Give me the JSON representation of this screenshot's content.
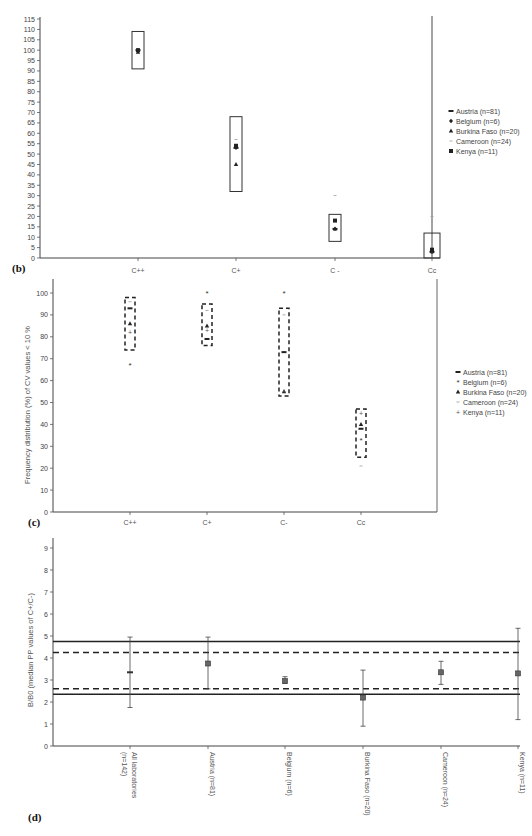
{
  "chart_data": [
    {
      "panel": "(b)",
      "type": "scatter",
      "title": "",
      "xlabel": "",
      "ylabel": "",
      "ylim": [
        0,
        115
      ],
      "yticks": [
        0,
        5,
        10,
        15,
        20,
        25,
        30,
        35,
        40,
        45,
        50,
        55,
        60,
        65,
        70,
        75,
        80,
        85,
        90,
        95,
        100,
        105,
        110,
        115
      ],
      "categories": [
        "C++",
        "C+",
        "C -",
        "Cc"
      ],
      "boxes": [
        {
          "category": "C++",
          "low": 91,
          "high": 109,
          "style": "solid"
        },
        {
          "category": "C+",
          "low": 32,
          "high": 68,
          "style": "solid"
        },
        {
          "category": "C -",
          "low": 8,
          "high": 21,
          "style": "solid"
        },
        {
          "category": "Cc",
          "low": 0,
          "high": 12,
          "style": "solid"
        }
      ],
      "series": [
        {
          "name": "Austria (n=81)",
          "marker": "dash",
          "values": [
            100,
            53,
            14,
            3
          ]
        },
        {
          "name": "Belgium (n=6)",
          "marker": "diamond",
          "values": [
            100,
            53,
            14,
            3
          ]
        },
        {
          "name": "Burkina Faso (n=20)",
          "marker": "triangle",
          "values": [
            99,
            45,
            14,
            3
          ]
        },
        {
          "name": "Cameroon (n=24)",
          "marker": "minus",
          "values": [
            100,
            57,
            30,
            20
          ]
        },
        {
          "name": "Kenya (n=11)",
          "marker": "square",
          "values": [
            100,
            54,
            18,
            4
          ]
        }
      ],
      "legend_position": "right",
      "grid": false
    },
    {
      "panel": "(c)",
      "type": "scatter",
      "title": "",
      "xlabel": "",
      "ylabel": "Frequency distribution (%) of CV values < 10 %",
      "ylim": [
        0,
        100
      ],
      "yticks": [
        0,
        10,
        20,
        30,
        40,
        50,
        60,
        70,
        80,
        90,
        100
      ],
      "categories": [
        "C++",
        "C+",
        "C-",
        "Cc"
      ],
      "boxes": [
        {
          "category": "C++",
          "low": 74,
          "high": 98,
          "style": "dashed"
        },
        {
          "category": "C+",
          "low": 76,
          "high": 95,
          "style": "dashed"
        },
        {
          "category": "C-",
          "low": 53,
          "high": 93,
          "style": "dashed"
        },
        {
          "category": "Cc",
          "low": 25,
          "high": 47,
          "style": "dashed"
        }
      ],
      "series": [
        {
          "name": "Austria (n=81)",
          "marker": "dash",
          "values": [
            93,
            79,
            73,
            38
          ]
        },
        {
          "name": "Belgium (n=6)",
          "marker": "asterisk",
          "values": [
            67,
            100,
            100,
            33
          ]
        },
        {
          "name": "Burkina Faso (n=20)",
          "marker": "triangle",
          "values": [
            86,
            85,
            55,
            40
          ]
        },
        {
          "name": "Cameroon (n=24)",
          "marker": "minus",
          "values": [
            96,
            92,
            90,
            21
          ]
        },
        {
          "name": "Kenya (n=11)",
          "marker": "plus",
          "values": [
            82,
            83,
            55,
            45
          ]
        }
      ],
      "legend_position": "right",
      "grid": false
    },
    {
      "panel": "(d)",
      "type": "scatter",
      "title": "",
      "xlabel": "",
      "ylabel": "B/B0 (median PP values of C+/C-)",
      "ylim": [
        0,
        9
      ],
      "yticks": [
        0,
        1,
        2,
        3,
        4,
        5,
        6,
        7,
        8,
        9
      ],
      "categories": [
        "All laboratories (n=142)",
        "Austria (n=81)",
        "Belgium (n=6)",
        "Burkina Faso (n=20)",
        "Cameroon (n=24)",
        "Kenya (n=11)"
      ],
      "series": [
        {
          "name": "median",
          "values": [
            3.35,
            3.75,
            2.95,
            2.2,
            3.35,
            3.3
          ]
        },
        {
          "name": "error_low",
          "values": [
            1.75,
            2.6,
            2.85,
            0.9,
            2.8,
            1.2
          ]
        },
        {
          "name": "error_high",
          "values": [
            4.95,
            4.95,
            3.15,
            3.45,
            3.85,
            5.35
          ]
        }
      ],
      "reference_lines": [
        {
          "y": 4.75,
          "style": "solid"
        },
        {
          "y": 4.25,
          "style": "dashed"
        },
        {
          "y": 2.6,
          "style": "dashed"
        },
        {
          "y": 2.35,
          "style": "solid"
        }
      ],
      "grid": false
    }
  ],
  "panels": {
    "b": {
      "label": "(b)",
      "yticks": [
        "0",
        "5",
        "10",
        "15",
        "20",
        "25",
        "30",
        "35",
        "40",
        "45",
        "50",
        "55",
        "60",
        "65",
        "70",
        "75",
        "80",
        "85",
        "90",
        "95",
        "100",
        "105",
        "110",
        "115"
      ],
      "categories": [
        "C++",
        "C+",
        "C -",
        "Cc"
      ],
      "legend": [
        "Austria (n=81)",
        "Belgium (n=6)",
        "Burkina Faso (n=20)",
        "Cameroon (n=24)",
        "Kenya (n=11)"
      ]
    },
    "c": {
      "label": "(c)",
      "ylabel": "Frequency distribution (%) of CV values < 10 %",
      "yticks": [
        "0",
        "10",
        "20",
        "30",
        "40",
        "50",
        "60",
        "70",
        "80",
        "90",
        "100"
      ],
      "categories": [
        "C++",
        "C+",
        "C-",
        "Cc"
      ],
      "legend": [
        "Austria (n=81)",
        "Belgium (n=6)",
        "Burkina Faso (n=20)",
        "Cameroon (n=24)",
        "Kenya (n=11)"
      ]
    },
    "d": {
      "label": "(d)",
      "ylabel": "B/B0 (median PP values of C+/C-)",
      "yticks": [
        "0",
        "1",
        "2",
        "3",
        "4",
        "5",
        "6",
        "7",
        "8",
        "9"
      ],
      "categories": [
        "All laboratories (n=142)",
        "Austria (n=81)",
        "Belgium (n=6)",
        "Burkina Faso (n=20)",
        "Cameroon (n=24)",
        "Kenya (n=11)"
      ],
      "category_lines": [
        [
          "All laboratories",
          "(n=142)"
        ],
        [
          "Austria (n=81)"
        ],
        [
          "Belgium (n=6)"
        ],
        [
          "Burkina Faso (n=20)"
        ],
        [
          "Cameroon (n=24)"
        ],
        [
          "Kenya (n=11)"
        ]
      ]
    }
  }
}
